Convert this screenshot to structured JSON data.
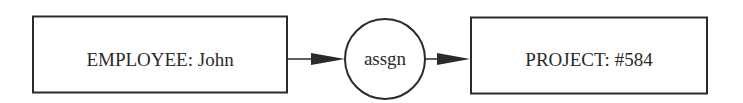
{
  "diagram": {
    "type": "conceptual-graph",
    "nodes": [
      {
        "id": "employee",
        "shape": "rectangle",
        "label": "EMPLOYEE: John"
      },
      {
        "id": "relation",
        "shape": "circle",
        "label": "assgn"
      },
      {
        "id": "project",
        "shape": "rectangle",
        "label": "PROJECT: #584"
      }
    ],
    "edges": [
      {
        "from": "employee",
        "to": "relation",
        "arrow": "filled"
      },
      {
        "from": "relation",
        "to": "project",
        "arrow": "filled"
      }
    ],
    "colors": {
      "stroke": "#2a2a2a",
      "background": "#ffffff"
    }
  }
}
